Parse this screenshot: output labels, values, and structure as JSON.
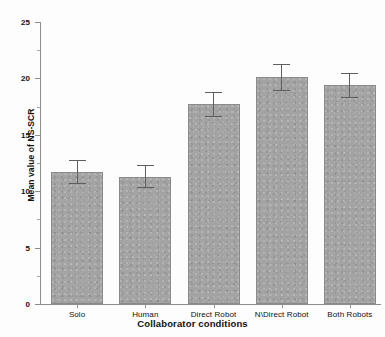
{
  "chart_data": {
    "type": "bar",
    "title": "",
    "xlabel": "Collaborator conditions",
    "ylabel": "Mean value of NS-SCR",
    "categories": [
      "Solo",
      "Human",
      "Direct Robot",
      "N\\Direct Robot",
      "Both Robots"
    ],
    "values": [
      11.7,
      11.3,
      17.7,
      20.1,
      19.4
    ],
    "errors": [
      1.1,
      1.0,
      1.1,
      1.2,
      1.1
    ],
    "error_type": "symmetric",
    "ylim": [
      0,
      25
    ],
    "yticks": [
      0,
      5,
      10,
      15,
      20,
      25
    ],
    "ytick_labels": [
      "0",
      "5",
      "10",
      "15",
      "20",
      "25"
    ],
    "yminor_ticks": [
      2.5,
      7.5,
      12.5,
      17.5,
      22.5
    ],
    "grid": false,
    "legend": "none",
    "bar_color": "#a3a3a3",
    "bar_edge_color": "#8a8a8a",
    "error_color": "#5e5e5e",
    "axis_color": "#8d8d8d"
  }
}
